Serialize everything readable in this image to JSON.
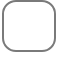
{
  "element": {
    "type": "rounded-square-outline",
    "border_color": "#7a7a7a",
    "fill_color": "#ffffff"
  }
}
